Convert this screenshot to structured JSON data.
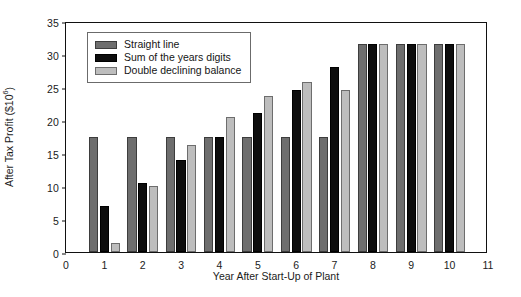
{
  "chart_data": {
    "type": "bar",
    "title": "",
    "xlabel": "Year After Start-Up of Plant",
    "ylabel": "After Tax Profit ($10^6)",
    "ylabel_base": "After Tax Profit ($10",
    "ylabel_exp": "6",
    "ylabel_close": ")",
    "categories": [
      "1",
      "2",
      "3",
      "4",
      "5",
      "6",
      "7",
      "8",
      "9",
      "10"
    ],
    "x": [
      1,
      2,
      3,
      4,
      5,
      6,
      7,
      8,
      9,
      10
    ],
    "xlim": [
      0,
      11
    ],
    "ylim": [
      0,
      35
    ],
    "xticks": [
      "0",
      "1",
      "2",
      "3",
      "4",
      "5",
      "6",
      "7",
      "8",
      "9",
      "10",
      "11"
    ],
    "yticks": [
      "0",
      "5",
      "10",
      "15",
      "20",
      "25",
      "30",
      "35"
    ],
    "grid": false,
    "legend_position": "upper-left",
    "series": [
      {
        "name": "Straight line",
        "color": "#6e6e6e",
        "values": [
          17.5,
          17.5,
          17.5,
          17.5,
          17.5,
          17.5,
          17.5,
          31.5,
          31.5,
          31.5
        ]
      },
      {
        "name": "Sum of the years digits",
        "color": "#0d0d0d",
        "values": [
          7.0,
          10.4,
          14.0,
          17.5,
          21.0,
          24.5,
          28.0,
          31.5,
          31.5,
          31.5
        ]
      },
      {
        "name": "Double declining balance",
        "color": "#bdbdbd",
        "values": [
          1.3,
          10.0,
          16.2,
          20.5,
          23.7,
          25.8,
          24.5,
          31.5,
          31.5,
          31.5
        ]
      }
    ]
  },
  "figure": {
    "background": "#ffffff",
    "axis_color": "#111111"
  }
}
